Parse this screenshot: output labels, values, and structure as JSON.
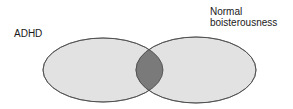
{
  "diagram": {
    "type": "venn",
    "sets": [
      {
        "id": "left",
        "label": "ADHD"
      },
      {
        "id": "right",
        "label_line1": "Normal",
        "label_line2": "boisterousness"
      }
    ],
    "colors": {
      "set_fill": "#e2e2e2",
      "overlap_fill": "#7a7a7a",
      "stroke": "#4a4a4a",
      "background": "#ffffff"
    }
  }
}
